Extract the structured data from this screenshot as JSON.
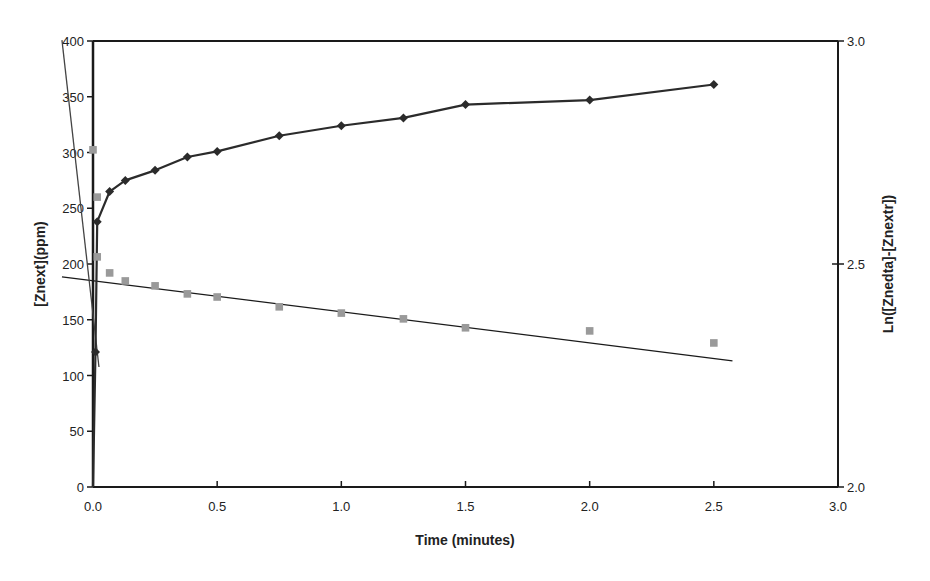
{
  "chart_data": {
    "type": "scatter",
    "title": "",
    "xlabel": "Time (minutes)",
    "ylabel": "[Znext](ppm)",
    "y2label": "Ln([Znedta]-[Znextr])",
    "xlim": [
      0,
      3.0
    ],
    "ylim": [
      0,
      400
    ],
    "y2lim": [
      2.0,
      3.0
    ],
    "x_ticks": [
      "0.0",
      "0.5",
      "1.0",
      "1.5",
      "2.0",
      "2.5",
      "3.0"
    ],
    "y_ticks": [
      "0",
      "50",
      "100",
      "150",
      "200",
      "250",
      "300",
      "350",
      "400"
    ],
    "y2_ticks": [
      "2.0",
      "2.5",
      "3.0"
    ],
    "grid": false,
    "legend": null,
    "series": [
      {
        "name": "[Znext] (ppm)",
        "axis": "left",
        "marker": "diamond",
        "line": true,
        "color": "#2b2b2b",
        "x": [
          0.0,
          0.01,
          0.017,
          0.067,
          0.13,
          0.25,
          0.38,
          0.5,
          0.75,
          1.0,
          1.25,
          1.5,
          2.0,
          2.5
        ],
        "values": [
          0,
          121,
          238,
          265,
          275,
          284,
          296,
          301,
          315,
          324,
          331,
          343,
          347,
          361
        ]
      },
      {
        "name": "Ln([Znedta]-[Znextr])",
        "axis": "right",
        "marker": "square",
        "line": false,
        "color": "#9a9a9a",
        "x": [
          0.0,
          0.017,
          0.017,
          0.067,
          0.13,
          0.25,
          0.38,
          0.5,
          0.75,
          1.0,
          1.25,
          1.5,
          2.0,
          2.5
        ],
        "values": [
          2.756,
          2.65,
          2.516,
          2.48,
          2.462,
          2.451,
          2.433,
          2.426,
          2.404,
          2.39,
          2.377,
          2.357,
          2.35,
          2.323
        ]
      }
    ],
    "trendlines": [
      {
        "name": "linear fit (long-time)",
        "axis": "right",
        "color": "#1a1a1a",
        "x": [
          -0.125,
          2.575
        ],
        "values": [
          2.471,
          2.283
        ]
      },
      {
        "name": "linear fit (initial)",
        "axis": "right",
        "color": "#444444",
        "x": [
          -0.125,
          0.024
        ],
        "values": [
          3.002,
          2.269
        ]
      }
    ]
  }
}
